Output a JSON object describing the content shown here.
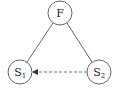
{
  "diagram": {
    "type": "graph",
    "colors": {
      "stroke": "#555555",
      "edge": "#555555",
      "dashed_edge": "#666666",
      "background": "#ffffff"
    },
    "nodes": [
      {
        "id": "F",
        "label": "F",
        "subscript": "",
        "cx": 60,
        "cy": 13,
        "r": 12
      },
      {
        "id": "S1",
        "label": "S",
        "subscript": "1",
        "cx": 20,
        "cy": 72,
        "r": 12
      },
      {
        "id": "S2",
        "label": "S",
        "subscript": "2",
        "cx": 99,
        "cy": 72,
        "r": 12
      }
    ],
    "edges": [
      {
        "from": "F",
        "to": "S1",
        "style": "solid",
        "directed": false
      },
      {
        "from": "F",
        "to": "S2",
        "style": "solid",
        "directed": false
      },
      {
        "from": "S2",
        "to": "S1",
        "style": "dashed",
        "directed": true
      }
    ]
  }
}
